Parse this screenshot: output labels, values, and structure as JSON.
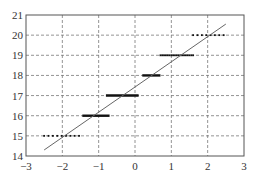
{
  "chart_data": {
    "type": "scatter",
    "title": "",
    "xlabel": "",
    "ylabel": "",
    "xlim": [
      -3,
      3
    ],
    "ylim": [
      14,
      21
    ],
    "grid": true,
    "grid_style": "dashed",
    "legend": null,
    "x_ticks": [
      -3,
      -2,
      -1,
      0,
      1,
      2,
      3
    ],
    "x_tick_labels": [
      "−3",
      "−2",
      "−1",
      "0",
      "1",
      "2",
      "3"
    ],
    "y_ticks": [
      14,
      15,
      16,
      17,
      18,
      19,
      20,
      21
    ],
    "y_tick_labels": [
      "14",
      "15",
      "16",
      "17",
      "18",
      "19",
      "20",
      "21"
    ],
    "series": [
      {
        "name": "fit-line",
        "kind": "line",
        "x": [
          -2.5,
          2.5
        ],
        "y": [
          14.3,
          20.55
        ]
      },
      {
        "name": "quantized-points",
        "kind": "horizontal-clusters",
        "clusters": [
          {
            "y": 15,
            "x_start": -2.5,
            "x_end": -1.45,
            "density": "sparse"
          },
          {
            "y": 16,
            "x_start": -1.45,
            "x_end": -0.7,
            "density": "dense"
          },
          {
            "y": 17,
            "x_start": -0.8,
            "x_end": 0.1,
            "density": "dense"
          },
          {
            "y": 18,
            "x_start": 0.2,
            "x_end": 0.7,
            "density": "dense"
          },
          {
            "y": 19,
            "x_start": 0.7,
            "x_end": 1.6,
            "density": "medium"
          },
          {
            "y": 20,
            "x_start": 1.6,
            "x_end": 2.5,
            "density": "sparse"
          }
        ]
      }
    ],
    "colors": {
      "line": "#666666",
      "points": "#111111",
      "grid": "#777777",
      "axes": "#555555"
    }
  }
}
